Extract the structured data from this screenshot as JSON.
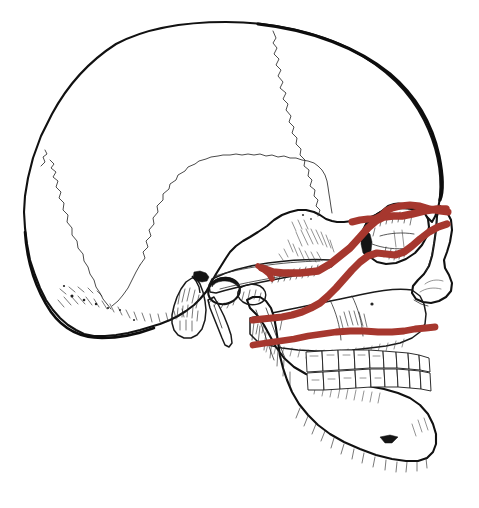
{
  "figure": {
    "background_color": "#ffffff",
    "outline_color": "#111111",
    "suture_color": "#2b2b2b",
    "fracture_color": "#A6372E",
    "width": 479,
    "height": 508
  },
  "legend": {
    "visible": false,
    "entries": []
  },
  "annotations": {
    "labels": [],
    "caption": ""
  },
  "fracture_lines": [
    {
      "id": "le-fort-3",
      "name": "Le Fort III fracture line",
      "level": "III",
      "description": "Craniofacial disjunction — runs through the nasofrontal suture, medial orbital wall, orbital floor, lateral orbital wall and zygomatic arch",
      "color": "#A6372E",
      "stroke_width": 7.5,
      "path": "M 262 268 L 273 272 L 283 273 L 300 273 L 318 271 L 330 264 L 340 256 L 350 248 L 360 237 L 368 228 L 376 221 L 384 217 L 393 216 L 402 216 L 412 214 L 424 211 L 437 209 L 446 209"
    },
    {
      "id": "le-fort-3-upper",
      "name": "Le Fort III upper nasofrontal segment",
      "level": "III",
      "description": "Superior limb rising to the frontonasal suture and frontozygomatic suture",
      "color": "#A6372E",
      "stroke_width": 7.0,
      "path": "M 352 222 L 360 220 L 368 219 L 375 219 L 381 216 L 386 211 L 392 208 L 400 206 L 410 205 L 420 206 L 430 209 L 440 211 L 448 212"
    },
    {
      "id": "le-fort-2",
      "name": "Le Fort II fracture line",
      "level": "II",
      "description": "Pyramidal fracture — from the nasal bridge across the medial orbital wall, infraorbital rim, and down the lateral maxilla to the pterygoid plates",
      "color": "#A6372E",
      "stroke_width": 7.2,
      "path": "M 447 224 L 438 227 L 429 232 L 420 239 L 412 246 L 404 252 L 395 255 L 386 254 L 377 253 L 368 256 L 360 262 L 352 270 L 344 279 L 336 288 L 328 296 L 320 303 L 311 308 L 302 312 L 292 315 L 282 317 L 272 318 L 262 319 L 253 320"
    },
    {
      "id": "le-fort-1",
      "name": "Le Fort I fracture line",
      "level": "I",
      "description": "Guerin fracture — horizontal fracture of the maxilla above the dental apices, separating the palate from the midface",
      "color": "#A6372E",
      "stroke_width": 6.8,
      "path": "M 253 345 L 266 343 L 280 341 L 294 339 L 308 336 L 322 334 L 336 332 L 350 331 L 364 331 L 378 332 L 392 332 L 404 331 L 415 329 L 426 328 L 435 327"
    },
    {
      "id": "zygomatic-arch-marker",
      "name": "Zygomatic arch fracture segment",
      "level": "III",
      "description": "Isolated red marking where the fracture crosses the zygomatic arch",
      "color": "#A6372E",
      "stroke_width": 5.5,
      "path": "M 258 266 L 264 270 L 269 274 L 272 279"
    }
  ],
  "anatomy": {
    "regions": [
      {
        "id": "cranial-vault",
        "name": "Cranial vault (frontal and parietal bones)"
      },
      {
        "id": "coronal-suture",
        "name": "Coronal suture"
      },
      {
        "id": "squamous-suture",
        "name": "Squamous suture of temporal bone"
      },
      {
        "id": "lambdoid-suture",
        "name": "Lambdoid suture"
      },
      {
        "id": "temporal-bone",
        "name": "Temporal bone"
      },
      {
        "id": "zygomatic-arch",
        "name": "Zygomatic arch"
      },
      {
        "id": "orbit",
        "name": "Orbital cavity"
      },
      {
        "id": "nasal-aperture",
        "name": "Nasal bone and anterior nasal aperture"
      },
      {
        "id": "maxilla",
        "name": "Maxilla"
      },
      {
        "id": "mandible",
        "name": "Mandible"
      },
      {
        "id": "mastoid-process",
        "name": "Mastoid process"
      },
      {
        "id": "styloid-process",
        "name": "Styloid process"
      },
      {
        "id": "external-acoustic-meatus",
        "name": "External acoustic meatus"
      },
      {
        "id": "mental-foramen",
        "name": "Mental foramen"
      },
      {
        "id": "teeth-upper",
        "name": "Maxillary dental arch"
      },
      {
        "id": "teeth-lower",
        "name": "Mandibular dental arch"
      },
      {
        "id": "occipital-bone",
        "name": "Occipital bone"
      },
      {
        "id": "condylar-process",
        "name": "Condylar process of mandible"
      },
      {
        "id": "coronoid-process",
        "name": "Coronoid process of mandible"
      }
    ]
  }
}
